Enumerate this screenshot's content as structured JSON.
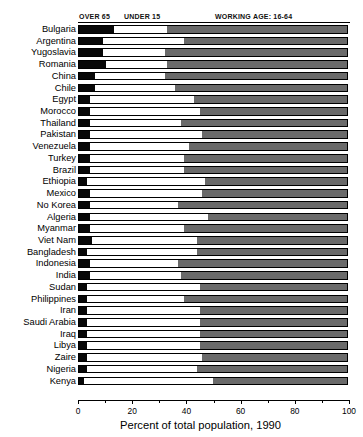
{
  "chart_data": {
    "type": "bar",
    "orientation": "horizontal",
    "stacked": true,
    "title": "",
    "xlabel": "Percent of total population, 1990",
    "ylabel": "",
    "xlim": [
      0,
      100
    ],
    "xticks": [
      0,
      20,
      40,
      60,
      80,
      100
    ],
    "xticklabels": [
      "0",
      "20",
      "40",
      "60",
      "80",
      "100"
    ],
    "grid": false,
    "legend_position": "top",
    "legend": [
      "OVER 65",
      "UNDER 15",
      "WORKING AGE: 16-64"
    ],
    "series": [
      {
        "name": "OVER 65",
        "color": "#080808"
      },
      {
        "name": "UNDER 15",
        "color": "#ffffff"
      },
      {
        "name": "WORKING AGE: 16-64",
        "color": "#6a6a6a"
      }
    ],
    "categories": [
      "Bulgaria",
      "Argentina",
      "Yugoslavia",
      "Romania",
      "China",
      "Chile",
      "Egypt",
      "Morocco",
      "Thailand",
      "Pakistan",
      "Venezuela",
      "Turkey",
      "Brazil",
      "Ethiopia",
      "Mexico",
      "No Korea",
      "Algeria",
      "Myanmar",
      "Viet Nam",
      "Bangladesh",
      "Indonesia",
      "India",
      "Sudan",
      "Philippines",
      "Iran",
      "Saudi Arabia",
      "Iraq",
      "Libya",
      "Zaire",
      "Nigeria",
      "Kenya"
    ],
    "rows": [
      {
        "country": "Bulgaria",
        "over65": 13,
        "under15": 20,
        "working": 67
      },
      {
        "country": "Argentina",
        "over65": 9,
        "under15": 30,
        "working": 61
      },
      {
        "country": "Yugoslavia",
        "over65": 9,
        "under15": 23,
        "working": 68
      },
      {
        "country": "Romania",
        "over65": 10,
        "under15": 23,
        "working": 67
      },
      {
        "country": "China",
        "over65": 6,
        "under15": 26,
        "working": 68
      },
      {
        "country": "Chile",
        "over65": 6,
        "under15": 30,
        "working": 64
      },
      {
        "country": "Egypt",
        "over65": 4,
        "under15": 39,
        "working": 57
      },
      {
        "country": "Morocco",
        "over65": 4,
        "under15": 41,
        "working": 55
      },
      {
        "country": "Thailand",
        "over65": 4,
        "under15": 34,
        "working": 62
      },
      {
        "country": "Pakistan",
        "over65": 4,
        "under15": 42,
        "working": 54
      },
      {
        "country": "Venezuela",
        "over65": 4,
        "under15": 37,
        "working": 59
      },
      {
        "country": "Turkey",
        "over65": 4,
        "under15": 35,
        "working": 61
      },
      {
        "country": "Brazil",
        "over65": 4,
        "under15": 35,
        "working": 61
      },
      {
        "country": "Ethiopia",
        "over65": 3,
        "under15": 44,
        "working": 53
      },
      {
        "country": "Mexico",
        "over65": 4,
        "under15": 42,
        "working": 54
      },
      {
        "country": "No Korea",
        "over65": 4,
        "under15": 33,
        "working": 63
      },
      {
        "country": "Algeria",
        "over65": 4,
        "under15": 44,
        "working": 52
      },
      {
        "country": "Myanmar",
        "over65": 4,
        "under15": 35,
        "working": 61
      },
      {
        "country": "Viet Nam",
        "over65": 5,
        "under15": 39,
        "working": 56
      },
      {
        "country": "Bangladesh",
        "over65": 3,
        "under15": 41,
        "working": 56
      },
      {
        "country": "Indonesia",
        "over65": 4,
        "under15": 33,
        "working": 63
      },
      {
        "country": "India",
        "over65": 4,
        "under15": 34,
        "working": 62
      },
      {
        "country": "Sudan",
        "over65": 3,
        "under15": 42,
        "working": 55
      },
      {
        "country": "Philippines",
        "over65": 3,
        "under15": 36,
        "working": 61
      },
      {
        "country": "Iran",
        "over65": 3,
        "under15": 42,
        "working": 55
      },
      {
        "country": "Saudi Arabia",
        "over65": 3,
        "under15": 42,
        "working": 55
      },
      {
        "country": "Iraq",
        "over65": 3,
        "under15": 42,
        "working": 55
      },
      {
        "country": "Libya",
        "over65": 3,
        "under15": 42,
        "working": 55
      },
      {
        "country": "Zaire",
        "over65": 3,
        "under15": 43,
        "working": 54
      },
      {
        "country": "Nigeria",
        "over65": 3,
        "under15": 41,
        "working": 56
      },
      {
        "country": "Kenya",
        "over65": 2,
        "under15": 48,
        "working": 50
      }
    ]
  },
  "legend": {
    "over65": "OVER 65",
    "under15": "UNDER 15",
    "working": "WORKING AGE: 16-64"
  },
  "axis": {
    "title": "Percent of total population, 1990",
    "ticks": [
      "0",
      "20",
      "40",
      "60",
      "80",
      "100"
    ]
  },
  "colors": {
    "over65": "#080808",
    "under15": "#ffffff",
    "working": "#6a6a6a",
    "outline": "#000000",
    "background": "#ffffff"
  }
}
